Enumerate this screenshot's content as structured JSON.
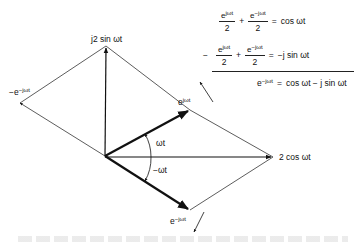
{
  "diagram": {
    "type": "phasor-diagram",
    "colors": {
      "stroke": "#111111",
      "thin_stroke": "#333333",
      "background": "#ffffff"
    },
    "labels": {
      "top": {
        "prefix": "j2 sin ",
        "omega_t": "ωt"
      },
      "left": {
        "base": "−e",
        "exp": "−jωt"
      },
      "upper_phasor": {
        "base": "e",
        "exp": "jωt"
      },
      "lower_phasor": {
        "base": "e",
        "exp": "−jωt"
      },
      "right": {
        "text": "2 cos ωt"
      },
      "angle_pos": "ωt",
      "angle_neg": "−ωt"
    },
    "equations": [
      {
        "lead": "",
        "t1": {
          "num_base": "e",
          "num_exp": "jωt",
          "den": "2"
        },
        "op": "+",
        "t2": {
          "num_base": "e",
          "num_exp": "−jωt",
          "den": "2"
        },
        "eq": "=",
        "rhs": "cos ωt"
      },
      {
        "lead": "−",
        "t1": {
          "num_base": "e",
          "num_exp": "jωt",
          "den": "2"
        },
        "op": "+",
        "t2": {
          "num_base": "e",
          "num_exp": "−jωt",
          "den": "2"
        },
        "eq": "=",
        "rhs": "−j sin ωt"
      }
    ],
    "result": {
      "lhs_base": "e",
      "lhs_exp": "−jωt",
      "eq": "=",
      "rhs": "cos ωt − j sin ωt"
    }
  }
}
